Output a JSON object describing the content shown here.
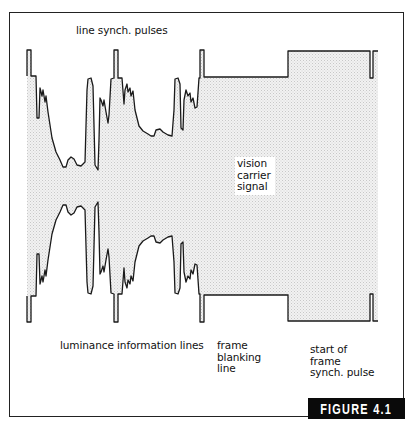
{
  "figure": {
    "label": "FIGURE 4.1",
    "colors": {
      "line": "#1a1a1a",
      "carrier_fill": "#e6e6e6",
      "badge_bg": "#0a0a0a",
      "badge_text": "#ffffff"
    }
  },
  "labels": {
    "line_synch_pulses": "line synch. pulses",
    "luminance_information_lines": "luminance information lines",
    "vision_carrier_signal": "vision\ncarrier\nsignal",
    "frame_blanking_line": "frame\nblanking\nline",
    "start_of_frame_synch_pulse": "start of\nframe\nsynch. pulse"
  },
  "waveform": {
    "midline_y": 186,
    "top_envelope_points": [
      [
        27,
        76
      ],
      [
        27,
        50
      ],
      [
        31,
        50
      ],
      [
        31,
        76
      ],
      [
        36,
        76
      ],
      [
        37,
        118
      ],
      [
        39,
        118
      ],
      [
        40,
        88
      ],
      [
        42,
        96
      ],
      [
        43,
        90
      ],
      [
        45,
        102
      ],
      [
        46,
        96
      ],
      [
        48,
        112
      ],
      [
        52,
        138
      ],
      [
        56,
        152
      ],
      [
        60,
        160
      ],
      [
        63,
        167
      ],
      [
        66,
        167
      ],
      [
        68,
        160
      ],
      [
        71,
        157
      ],
      [
        74,
        159
      ],
      [
        77,
        165
      ],
      [
        81,
        166
      ],
      [
        85,
        162
      ],
      [
        87,
        90
      ],
      [
        88,
        79
      ],
      [
        91,
        78
      ],
      [
        93,
        86
      ],
      [
        95,
        165
      ],
      [
        98,
        170
      ],
      [
        99,
        140
      ],
      [
        100,
        98
      ],
      [
        101,
        100
      ],
      [
        103,
        106
      ],
      [
        104,
        100
      ],
      [
        106,
        112
      ],
      [
        108,
        123
      ],
      [
        109,
        115
      ],
      [
        111,
        79
      ],
      [
        114,
        78
      ],
      [
        114,
        50
      ],
      [
        118,
        50
      ],
      [
        118,
        78
      ],
      [
        122,
        78
      ],
      [
        124,
        104
      ],
      [
        125,
        90
      ],
      [
        127,
        84
      ],
      [
        128,
        92
      ],
      [
        130,
        88
      ],
      [
        131,
        96
      ],
      [
        133,
        91
      ],
      [
        135,
        110
      ],
      [
        139,
        126
      ],
      [
        143,
        131
      ],
      [
        148,
        134
      ],
      [
        151,
        136
      ],
      [
        154,
        136
      ],
      [
        156,
        130
      ],
      [
        160,
        129
      ],
      [
        163,
        132
      ],
      [
        168,
        135
      ],
      [
        172,
        136
      ],
      [
        174,
        110
      ],
      [
        175,
        79
      ],
      [
        178,
        78
      ],
      [
        180,
        84
      ],
      [
        181,
        128
      ],
      [
        183,
        130
      ],
      [
        184,
        100
      ],
      [
        186,
        90
      ],
      [
        188,
        96
      ],
      [
        190,
        93
      ],
      [
        191,
        102
      ],
      [
        193,
        98
      ],
      [
        195,
        108
      ],
      [
        197,
        107
      ],
      [
        199,
        78
      ],
      [
        200,
        78
      ],
      [
        200,
        50
      ],
      [
        204,
        50
      ],
      [
        204,
        77
      ],
      [
        288,
        77
      ],
      [
        288,
        51
      ],
      [
        370,
        51
      ],
      [
        370,
        78
      ],
      [
        373,
        78
      ],
      [
        373,
        51
      ],
      [
        378,
        51
      ]
    ]
  }
}
